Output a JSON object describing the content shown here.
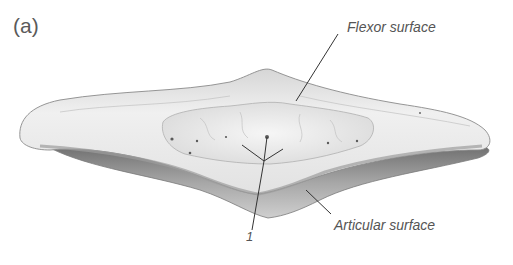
{
  "figure": {
    "panel_label": "(a)",
    "labels": {
      "flexor_surface": "Flexor surface",
      "articular_surface": "Articular surface",
      "marker_1": "1"
    },
    "colors": {
      "background": "#ffffff",
      "bone_light": "#ececec",
      "bone_mid": "#c4c4c4",
      "bone_dark": "#8a8a8a",
      "leader_line": "#333333",
      "text": "#555555"
    }
  }
}
